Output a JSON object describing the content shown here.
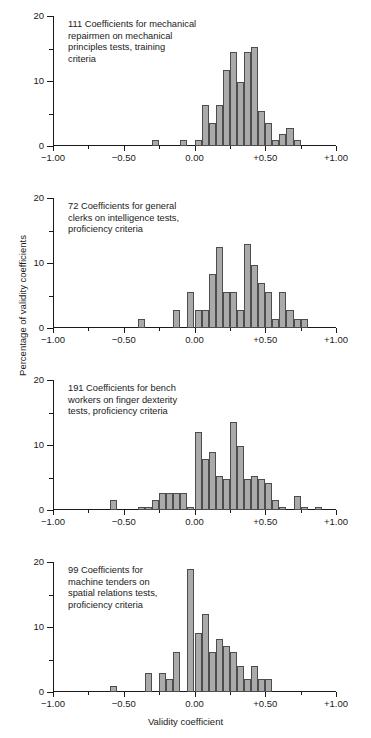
{
  "figure": {
    "xlabel": "Validity coefficient",
    "ylabel": "Percentage of validity coefficients",
    "bar_color": "#aaaaaa",
    "bar_edge_color": "#4d4d4d",
    "axis_color": "#1a1a1a"
  },
  "axes": {
    "x_tick_labels": [
      "−1.00",
      "−0.50",
      "0.00",
      "+0.50",
      "+1.00"
    ],
    "x_tick_values": [
      -1.0,
      -0.5,
      0.0,
      0.5,
      1.0
    ],
    "x_minor_values": [
      -0.75,
      -0.25,
      0.25,
      0.75
    ],
    "y_tick_labels": [
      "0",
      "10",
      "20"
    ],
    "y_tick_values": [
      0,
      10,
      20
    ],
    "y_minor_values": [
      5,
      15
    ],
    "xlim": [
      -1.0,
      1.0
    ],
    "ylim": [
      0,
      20
    ]
  },
  "chart_data": [
    {
      "type": "bar",
      "id": "panel-1",
      "title": "111 Coefficients for mechanical\nrepairmen on mechanical\nprinciples tests, training\ncriteria",
      "n_coefficients": 111,
      "xlabel": "Validity coefficient",
      "ylabel": "Percentage of validity coefficients",
      "xlim": [
        -1.0,
        1.0
      ],
      "ylim": [
        0,
        20
      ],
      "bin_width": 0.05,
      "bins": [
        {
          "x": -0.3,
          "value": 1.0
        },
        {
          "x": -0.1,
          "value": 1.0
        },
        {
          "x": 0.0,
          "value": 1.0
        },
        {
          "x": 0.05,
          "value": 6.3
        },
        {
          "x": 0.1,
          "value": 3.6
        },
        {
          "x": 0.15,
          "value": 6.3
        },
        {
          "x": 0.2,
          "value": 11.7
        },
        {
          "x": 0.25,
          "value": 14.4
        },
        {
          "x": 0.3,
          "value": 9.9
        },
        {
          "x": 0.35,
          "value": 14.4
        },
        {
          "x": 0.4,
          "value": 15.3
        },
        {
          "x": 0.45,
          "value": 5.4
        },
        {
          "x": 0.5,
          "value": 3.6
        },
        {
          "x": 0.55,
          "value": 1.0
        },
        {
          "x": 0.6,
          "value": 1.8
        },
        {
          "x": 0.65,
          "value": 2.7
        },
        {
          "x": 0.7,
          "value": 1.0
        }
      ]
    },
    {
      "type": "bar",
      "id": "panel-2",
      "title": "72 Coefficients for general\nclerks on intelligence tests,\nproficiency criteria",
      "n_coefficients": 72,
      "xlabel": "Validity coefficient",
      "ylabel": "Percentage of validity coefficients",
      "xlim": [
        -1.0,
        1.0
      ],
      "ylim": [
        0,
        20
      ],
      "bin_width": 0.05,
      "bins": [
        {
          "x": -0.4,
          "value": 1.4
        },
        {
          "x": -0.15,
          "value": 2.8
        },
        {
          "x": -0.05,
          "value": 5.6
        },
        {
          "x": 0.0,
          "value": 2.8
        },
        {
          "x": 0.05,
          "value": 2.8
        },
        {
          "x": 0.1,
          "value": 8.3
        },
        {
          "x": 0.15,
          "value": 12.5
        },
        {
          "x": 0.2,
          "value": 5.6
        },
        {
          "x": 0.25,
          "value": 5.6
        },
        {
          "x": 0.3,
          "value": 2.8
        },
        {
          "x": 0.35,
          "value": 13.0
        },
        {
          "x": 0.4,
          "value": 9.7
        },
        {
          "x": 0.45,
          "value": 6.9
        },
        {
          "x": 0.5,
          "value": 5.6
        },
        {
          "x": 0.55,
          "value": 1.4
        },
        {
          "x": 0.6,
          "value": 5.6
        },
        {
          "x": 0.65,
          "value": 2.8
        },
        {
          "x": 0.7,
          "value": 1.4
        },
        {
          "x": 0.75,
          "value": 1.4
        }
      ]
    },
    {
      "type": "bar",
      "id": "panel-3",
      "title": "191 Coefficients for bench\nworkers on finger dexterity\ntests, proficiency criteria",
      "n_coefficients": 191,
      "xlabel": "Validity coefficient",
      "ylabel": "Percentage of validity coefficients",
      "xlim": [
        -1.0,
        1.0
      ],
      "ylim": [
        0,
        20
      ],
      "bin_width": 0.05,
      "bins": [
        {
          "x": -0.6,
          "value": 1.5
        },
        {
          "x": -0.4,
          "value": 0.5
        },
        {
          "x": -0.35,
          "value": 0.5
        },
        {
          "x": -0.3,
          "value": 1.5
        },
        {
          "x": -0.25,
          "value": 2.6
        },
        {
          "x": -0.2,
          "value": 2.6
        },
        {
          "x": -0.15,
          "value": 2.6
        },
        {
          "x": -0.1,
          "value": 2.6
        },
        {
          "x": -0.05,
          "value": 0.5
        },
        {
          "x": 0.0,
          "value": 12.0
        },
        {
          "x": 0.05,
          "value": 7.9
        },
        {
          "x": 0.1,
          "value": 9.0
        },
        {
          "x": 0.15,
          "value": 5.2
        },
        {
          "x": 0.2,
          "value": 4.7
        },
        {
          "x": 0.25,
          "value": 13.6
        },
        {
          "x": 0.3,
          "value": 9.9
        },
        {
          "x": 0.35,
          "value": 4.7
        },
        {
          "x": 0.4,
          "value": 5.2
        },
        {
          "x": 0.45,
          "value": 4.7
        },
        {
          "x": 0.5,
          "value": 4.2
        },
        {
          "x": 0.55,
          "value": 1.5
        },
        {
          "x": 0.6,
          "value": 0.5
        },
        {
          "x": 0.7,
          "value": 2.1
        },
        {
          "x": 0.75,
          "value": 0.5
        },
        {
          "x": 0.85,
          "value": 0.5
        }
      ]
    },
    {
      "type": "bar",
      "id": "panel-4",
      "title": "99 Coefficients for\nmachine tenders on\nspatial relations tests,\nproficiency criteria",
      "n_coefficients": 99,
      "xlabel": "Validity coefficient",
      "ylabel": "Percentage of validity coefficients",
      "xlim": [
        -1.0,
        1.0
      ],
      "ylim": [
        0,
        20
      ],
      "bin_width": 0.05,
      "bins": [
        {
          "x": -0.6,
          "value": 1.0
        },
        {
          "x": -0.35,
          "value": 3.0
        },
        {
          "x": -0.25,
          "value": 3.0
        },
        {
          "x": -0.2,
          "value": 2.0
        },
        {
          "x": -0.15,
          "value": 6.1
        },
        {
          "x": -0.05,
          "value": 19.0
        },
        {
          "x": 0.0,
          "value": 9.1
        },
        {
          "x": 0.05,
          "value": 12.0
        },
        {
          "x": 0.1,
          "value": 6.1
        },
        {
          "x": 0.15,
          "value": 8.1
        },
        {
          "x": 0.2,
          "value": 7.1
        },
        {
          "x": 0.25,
          "value": 6.1
        },
        {
          "x": 0.3,
          "value": 4.0
        },
        {
          "x": 0.35,
          "value": 2.0
        },
        {
          "x": 0.4,
          "value": 4.0
        },
        {
          "x": 0.45,
          "value": 2.0
        },
        {
          "x": 0.5,
          "value": 2.0
        }
      ]
    }
  ]
}
